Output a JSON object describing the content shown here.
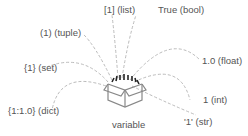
{
  "diagram": {
    "center_label": "variable",
    "values": [
      {
        "label": "[1] (list)"
      },
      {
        "label": "True (bool)"
      },
      {
        "label": "(1) (tuple)"
      },
      {
        "label": "{1} (set)"
      },
      {
        "label": "1.0 (float)"
      },
      {
        "label": "{1:1.0} (dict)"
      },
      {
        "label": "1 (int)"
      },
      {
        "label": "'1' (str)"
      }
    ],
    "colors": {
      "text": "#555555",
      "lines": "#bbbbbb",
      "box": "#888888",
      "arrows": "#222222"
    }
  }
}
